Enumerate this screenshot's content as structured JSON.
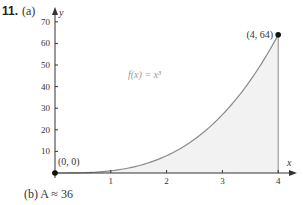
{
  "problem": {
    "number": "11.",
    "part_a_label": "(a)",
    "part_b_text": "(b) A ≈ 36"
  },
  "chart_data": {
    "type": "area",
    "title": "",
    "function_label": "f(x) = x³",
    "xlabel": "x",
    "ylabel": "y",
    "xlim": [
      0,
      4.3
    ],
    "ylim": [
      0,
      72
    ],
    "x_ticks": [
      1,
      2,
      3,
      4
    ],
    "y_ticks": [
      10,
      20,
      30,
      40,
      50,
      60,
      70
    ],
    "x": [
      0,
      0.5,
      1,
      1.5,
      2,
      2.5,
      3,
      3.5,
      4
    ],
    "series": [
      {
        "name": "f(x) = x^3",
        "values": [
          0,
          0.125,
          1,
          3.375,
          8,
          15.625,
          27,
          42.875,
          64
        ]
      }
    ],
    "shaded_region": {
      "from_x": 0,
      "to_x": 4,
      "under": "f(x) = x^3"
    },
    "points": [
      {
        "label": "(0, 0)",
        "x": 0,
        "y": 0
      },
      {
        "label": "(4, 64)",
        "x": 4,
        "y": 64
      }
    ],
    "grid": false,
    "legend": null
  },
  "colors": {
    "curve": "#8a8a8a",
    "fill": "#f2f2f2",
    "axis": "#333333",
    "text": "#333333",
    "function_label": "#9a9a9a"
  }
}
